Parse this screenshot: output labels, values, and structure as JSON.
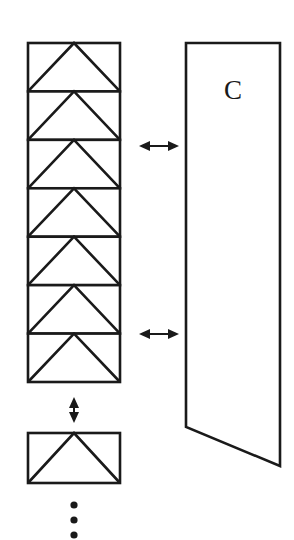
{
  "figure": {
    "background_color": "#ffffff",
    "stroke_color": "#1a1a1a",
    "canvas": {
      "width": 294,
      "height": 540
    },
    "right_shape": {
      "name": "quadrilateral-C",
      "label": "C",
      "label_x": 233,
      "label_y": 93,
      "points": "186,43 280,43 280,466 186,427",
      "description": "tall quadrilateral with slanted bottom edge"
    },
    "left_stack": {
      "name": "stacked-cell-column",
      "x": 28,
      "right": 120,
      "top": 43,
      "bottom": 382,
      "cell_count": 7,
      "cell_height": 48.43,
      "cells": [
        {
          "index": 1,
          "top": 43.0,
          "bottom": 91.4
        },
        {
          "index": 2,
          "top": 91.4,
          "bottom": 139.9
        },
        {
          "index": 3,
          "top": 139.9,
          "bottom": 188.3
        },
        {
          "index": 4,
          "top": 188.3,
          "bottom": 236.7
        },
        {
          "index": 5,
          "top": 236.7,
          "bottom": 285.1
        },
        {
          "index": 6,
          "top": 285.1,
          "bottom": 333.6
        },
        {
          "index": 7,
          "top": 333.6,
          "bottom": 382.0
        }
      ]
    },
    "detached_cell": {
      "name": "detached-cell",
      "x": 28,
      "right": 120,
      "top": 433,
      "bottom": 483
    },
    "arrows": [
      {
        "name": "horizontal-arrow-upper",
        "orientation": "horizontal",
        "x1": 140,
        "x2": 178,
        "y": 146,
        "glyph": "double-headed-arrow"
      },
      {
        "name": "horizontal-arrow-lower",
        "orientation": "horizontal",
        "x1": 140,
        "x2": 178,
        "y": 334,
        "glyph": "double-headed-arrow"
      },
      {
        "name": "vertical-arrow-gap",
        "orientation": "vertical",
        "x": 74,
        "y1": 398,
        "y2": 422,
        "glyph": "double-headed-arrow"
      }
    ],
    "ellipsis": {
      "name": "vertical-ellipsis",
      "x": 74,
      "dots": [
        505,
        520,
        535
      ],
      "radius": 3.6,
      "count": 3
    }
  }
}
